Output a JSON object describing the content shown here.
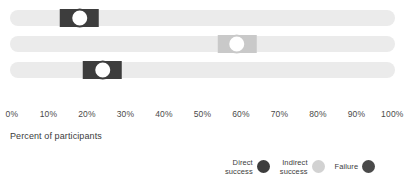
{
  "chart_data": {
    "type": "bar",
    "title": "",
    "subtitle": "",
    "xlabel": "Percent of participants",
    "ylabel": "",
    "xlim": [
      0,
      100
    ],
    "grid": false,
    "orientation": "horizontal",
    "legend_position": "bottom-right",
    "categories": [
      "Task 1",
      "Task 2",
      "Task 3"
    ],
    "tick_labels": [
      "0%",
      "10%",
      "20%",
      "30%",
      "40%",
      "50%",
      "60%",
      "70%",
      "80%",
      "90%",
      "100%"
    ],
    "tick_values": [
      0,
      10,
      20,
      30,
      40,
      50,
      60,
      70,
      80,
      90,
      100
    ],
    "series": [
      {
        "name": "Direct success",
        "color": "#3d3d3d",
        "values": [
          18,
          null,
          24
        ]
      },
      {
        "name": "Indirect success",
        "color": "#c9c9c9",
        "values": [
          null,
          59,
          null
        ]
      },
      {
        "name": "Failure",
        "color": "#4a4a4a",
        "values": [
          null,
          null,
          null
        ]
      }
    ],
    "markers": [
      {
        "row": 0,
        "value": 18,
        "label": "18%",
        "color": "#3d3d3d",
        "series": "Direct success",
        "rect_start": 13,
        "rect_end": 23
      },
      {
        "row": 1,
        "value": 59,
        "label": "59%",
        "color": "#c9c9c9",
        "series": "Indirect success",
        "rect_start": 54,
        "rect_end": 64
      },
      {
        "row": 2,
        "value": 24,
        "label": "24%",
        "color": "#3d3d3d",
        "series": "Direct success",
        "rect_start": 19,
        "rect_end": 29
      }
    ],
    "track_color": "#ebebeb"
  },
  "axis": {
    "title": "Percent of participants"
  },
  "legend": {
    "items": [
      {
        "label": "Direct\nsuccess",
        "color": "#3d3d3d",
        "name": "direct-success"
      },
      {
        "label": "Indirect\nsuccess",
        "color": "#d2d2d2",
        "name": "indirect-success"
      },
      {
        "label": "Failure",
        "color": "#4a4a4a",
        "name": "failure"
      }
    ]
  }
}
